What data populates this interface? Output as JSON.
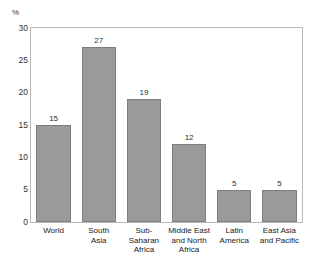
{
  "chart_data": {
    "type": "bar",
    "title": "",
    "title_note": "title cropped off top edge of screenshot",
    "xlabel": "",
    "ylabel": "%",
    "categories": [
      "World",
      "South\nAsia",
      "Sub-\nSaharan\nAfrica",
      "Middle East\nand North\nAfrica",
      "Latin\nAmerica",
      "East Asia\nand Pacific"
    ],
    "values": [
      15,
      27,
      19,
      12,
      5,
      5
    ],
    "value_labels": [
      "15",
      "27",
      "19",
      "12",
      "5",
      "5"
    ],
    "ylim": [
      0,
      30
    ],
    "yticks": [
      0,
      5,
      10,
      15,
      20,
      25,
      30
    ],
    "ytick_labels": [
      "0",
      "5",
      "10",
      "15",
      "20",
      "25",
      "30"
    ],
    "grid": false,
    "legend": false,
    "bar_color": "#9a9a9a",
    "bar_edge_color": "#7d7d7d",
    "frame_color": "#b9b9b9",
    "plot_background": "#ffffff"
  }
}
